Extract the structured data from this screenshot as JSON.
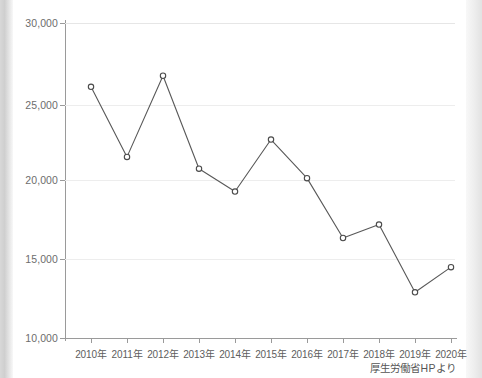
{
  "chart_data": {
    "type": "line",
    "title": "",
    "subtitle": "",
    "xlabel": "",
    "ylabel": "",
    "categories": [
      "2010年",
      "2011年",
      "2012年",
      "2013年",
      "2014年",
      "2015年",
      "2016年",
      "2017年",
      "2018年",
      "2019年",
      "2020年"
    ],
    "values": [
      25950,
      21500,
      26650,
      20750,
      19300,
      22600,
      20150,
      16350,
      17200,
      12900,
      14500
    ],
    "series": [
      {
        "name": "",
        "values": [
          25950,
          21500,
          26650,
          20750,
          19300,
          22600,
          20150,
          16350,
          17200,
          12900,
          14500
        ]
      }
    ],
    "ylim": [
      10000,
      30000
    ],
    "yticks": [
      10000,
      15000,
      20000,
      25000,
      30000
    ],
    "ytick_labels": [
      "10,000",
      "15,000",
      "20,000",
      "25,000",
      "30,000"
    ],
    "grid": true,
    "legend": false,
    "legend_position": "none",
    "marker": "open-circle",
    "line_color": "#585858",
    "marker_fill": "#ffffff",
    "marker_stroke": "#4a4a4a",
    "grid_color": "#ededed",
    "axis_color": "#9a9a9a",
    "annotations": [
      "厚生労働省HPより"
    ]
  },
  "figure": {
    "source_note": "厚生労働省HPより"
  }
}
